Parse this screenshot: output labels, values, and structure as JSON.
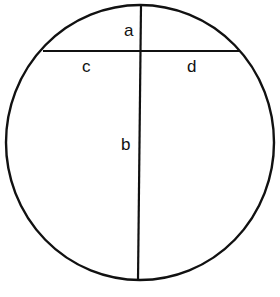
{
  "diagram": {
    "type": "intersecting-chords-circle",
    "stroke_color": "#111111",
    "background": "#ffffff",
    "circle": {
      "cx": 140,
      "cy": 142.5,
      "rx": 134,
      "ry": 137.5
    },
    "vertical_chord": {
      "x1": 141,
      "y1": 5,
      "x2": 138,
      "y2": 280
    },
    "horizontal_chord": {
      "x1": 43,
      "y1": 51,
      "x2": 240,
      "y2": 51
    },
    "labels": {
      "a": "a",
      "b": "b",
      "c": "c",
      "d": "d"
    }
  }
}
